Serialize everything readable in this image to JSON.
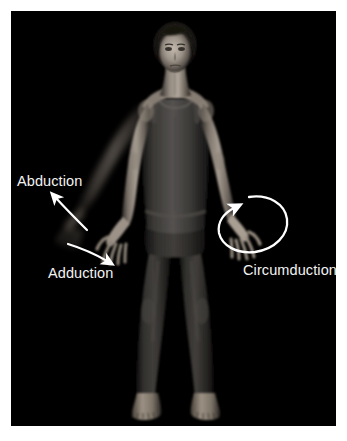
{
  "figure": {
    "kind": "anatomy-photograph",
    "background_color": "#000000",
    "frame_color": "#ffffff",
    "label_color": "#f2f2f2",
    "arrow_color": "#ffffff",
    "plate": {
      "x": 11,
      "y": 11,
      "width": 325,
      "height": 415
    }
  },
  "annotations": {
    "abduction": {
      "label": "Abduction",
      "icon": "curved-arrow-up-left-icon",
      "direction": "up-and-away-from-midline"
    },
    "adduction": {
      "label": "Adduction",
      "icon": "curved-arrow-down-right-icon",
      "direction": "down-and-toward-midline"
    },
    "circumduction": {
      "label": "Circumduction",
      "icon": "circular-loop-arrow-icon",
      "direction": "conical-circular-sweep"
    }
  },
  "subject_colors": {
    "skin_light": "#b9b1a8",
    "skin_mid": "#8a827a",
    "skin_shadow": "#4a443f",
    "skin_deep": "#262220",
    "garment_light": "#4e4b48",
    "garment_mid": "#343230",
    "garment_dark": "#1c1b1a",
    "hair": "#141312"
  }
}
